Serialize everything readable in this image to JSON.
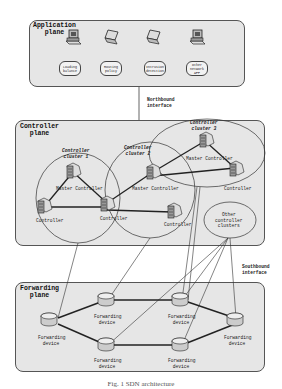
{
  "application_plane": {
    "title": "Application\nplane",
    "apps": [
      {
        "label": "Loading balance",
        "device": "desktop-icon"
      },
      {
        "label": "Routing policy",
        "device": "laptop-icon"
      },
      {
        "label": "Intrusion detection",
        "device": "laptop-icon"
      },
      {
        "label": "Other network APP",
        "device": "desktop-icon"
      }
    ]
  },
  "northbound": {
    "label": "Northbound\ninterface"
  },
  "controller_plane": {
    "title": "Controller\nplane",
    "clusters": [
      {
        "label": "Controller\ncluster 1",
        "master": "Master Controller",
        "controllers": [
          "Controller",
          "Controller"
        ]
      },
      {
        "label": "Controller\ncluster 2",
        "master": "Master Controller",
        "controllers": [
          "Controller",
          "Controller"
        ]
      },
      {
        "label": "Controller\ncluster 3",
        "master": "Master Controller",
        "controllers": [
          "Controller"
        ]
      }
    ],
    "other_clusters": "Other\ncontroller\nclusters"
  },
  "southbound": {
    "label": "Southbound\ninterface"
  },
  "forwarding_plane": {
    "title": "Forwarding\nplane",
    "devices": [
      "Forwarding device",
      "Forwarding device",
      "Forwarding device",
      "Forwarding device",
      "Forwarding device",
      "Forwarding device"
    ]
  },
  "caption": "Fig. 1  SDN architecture",
  "colors": {
    "plane_bg": "#e6e6e6",
    "border": "#555555",
    "line": "#222222"
  }
}
